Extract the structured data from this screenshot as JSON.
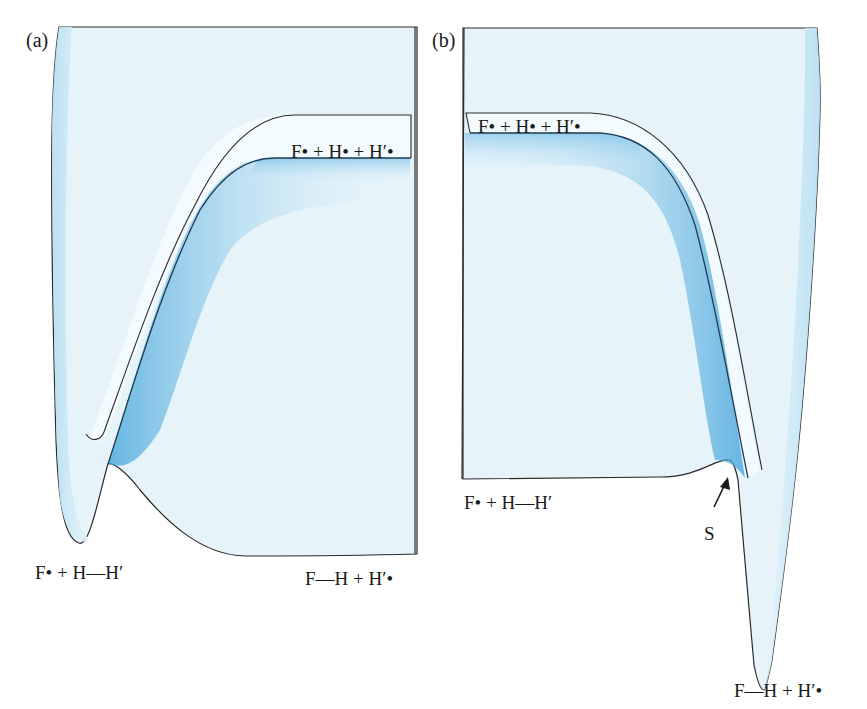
{
  "figure": {
    "panels": [
      {
        "id": "a",
        "tag": "(a)",
        "labels": {
          "plateau": "F• + H• + H′•",
          "reactants": "F• + H—H′",
          "products": "F—H + H′•"
        }
      },
      {
        "id": "b",
        "tag": "(b)",
        "labels": {
          "plateau": "F• + H• + H′•",
          "reactants": "F• + H—H′",
          "products": "F—H + H′•",
          "saddle": "S"
        }
      }
    ],
    "colors": {
      "surface_fill": "#e6f4fa",
      "shadow_blue": "#4aa8dc",
      "outline": "#2a2a2a"
    }
  }
}
